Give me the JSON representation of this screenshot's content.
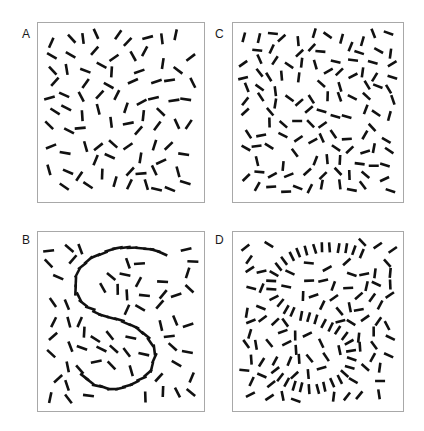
{
  "figure": {
    "width": 424,
    "height": 431,
    "background_color": "#ffffff",
    "element_color": "#111111",
    "frame_color": "#a8a8a8"
  },
  "panels": [
    {
      "id": "A",
      "label": "A",
      "label_x": 22,
      "label_y": 28,
      "frame": {
        "x": 37,
        "y": 22,
        "w": 168,
        "h": 181
      },
      "condition": "random-sparse",
      "has_contour": false,
      "contour_alignment": "none",
      "element_count": 104,
      "element_length": 11,
      "element_width": 2.6,
      "jitter_seed": 11
    },
    {
      "id": "B",
      "label": "B",
      "label_x": 22,
      "label_y": 234,
      "frame": {
        "x": 37,
        "y": 231,
        "w": 168,
        "h": 181
      },
      "condition": "contour-tangential",
      "has_contour": true,
      "contour_alignment": "tangent",
      "element_count": 104,
      "element_length": 11,
      "element_width": 2.6,
      "jitter_seed": 23
    },
    {
      "id": "C",
      "label": "C",
      "label_x": 215,
      "label_y": 28,
      "frame": {
        "x": 232,
        "y": 22,
        "w": 172,
        "h": 181
      },
      "condition": "random-dense",
      "has_contour": false,
      "contour_alignment": "none",
      "element_count": 150,
      "element_length": 10,
      "element_width": 2.6,
      "jitter_seed": 37
    },
    {
      "id": "D",
      "label": "D",
      "label_x": 215,
      "label_y": 234,
      "frame": {
        "x": 232,
        "y": 231,
        "w": 172,
        "h": 181
      },
      "condition": "contour-orthogonal",
      "has_contour": true,
      "contour_alignment": "orthogonal",
      "element_count": 150,
      "element_length": 10,
      "element_width": 2.6,
      "jitter_seed": 53
    }
  ],
  "contour_path": {
    "shape": "S",
    "description": "S-shaped contour path in normalized panel coordinates (0-1)",
    "element_spacing": 0.052,
    "points": [
      [
        0.78,
        0.085
      ],
      [
        0.7,
        0.055
      ],
      [
        0.6,
        0.045
      ],
      [
        0.49,
        0.05
      ],
      [
        0.39,
        0.072
      ],
      [
        0.3,
        0.11
      ],
      [
        0.235,
        0.165
      ],
      [
        0.2,
        0.235
      ],
      [
        0.198,
        0.305
      ],
      [
        0.228,
        0.37
      ],
      [
        0.285,
        0.42
      ],
      [
        0.36,
        0.455
      ],
      [
        0.445,
        0.48
      ],
      [
        0.53,
        0.505
      ],
      [
        0.61,
        0.54
      ],
      [
        0.675,
        0.59
      ],
      [
        0.715,
        0.655
      ],
      [
        0.722,
        0.725
      ],
      [
        0.7,
        0.793
      ],
      [
        0.648,
        0.85
      ],
      [
        0.575,
        0.89
      ],
      [
        0.49,
        0.912
      ],
      [
        0.4,
        0.91
      ],
      [
        0.318,
        0.885
      ],
      [
        0.252,
        0.84
      ],
      [
        0.21,
        0.782
      ]
    ]
  }
}
